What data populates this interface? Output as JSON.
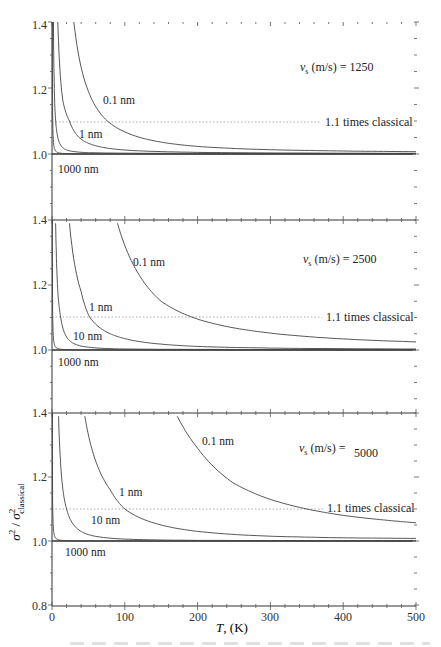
{
  "chart_data": {
    "type": "line",
    "layout": "3 vertically stacked panels sharing x-axis",
    "xlabel": "T, (K)",
    "ylabel": "σ²/σ²classical",
    "xlim": [
      0,
      500
    ],
    "x_ticks": [
      0,
      100,
      200,
      300,
      400,
      500
    ],
    "grid": false,
    "reference_line": {
      "y": 1.1,
      "style": "dotted",
      "label": "1.1 times classical"
    },
    "panels": [
      {
        "annotation": "vs (m/s) = 1250",
        "vs": 1250,
        "ylim": [
          0.8,
          1.4
        ],
        "y_tick_labels": [
          "1.4",
          "1.2",
          "1.0"
        ],
        "series": [
          {
            "name": "0.1 nm",
            "x": [
              30,
              50,
              76,
              100,
              150,
              200,
              300,
              400,
              500
            ],
            "y": [
              1.4,
              1.19,
              1.1,
              1.067,
              1.036,
              1.023,
              1.013,
              1.009,
              1.007
            ]
          },
          {
            "name": "1 nm",
            "x": [
              8,
              15,
              24,
              40,
              60,
              100,
              200,
              500
            ],
            "y": [
              1.4,
              1.16,
              1.1,
              1.045,
              1.025,
              1.012,
              1.005,
              1.002
            ]
          },
          {
            "name": "10 nm",
            "x": [
              2,
              4,
              8,
              20,
              50,
              500
            ],
            "y": [
              1.4,
              1.14,
              1.05,
              1.012,
              1.004,
              1.001
            ]
          },
          {
            "name": "1000 nm",
            "x": [
              0.5,
              1,
              3,
              10,
              500
            ],
            "y": [
              1.4,
              1.1,
              1.02,
              1.003,
              1.0
            ]
          }
        ]
      },
      {
        "annotation": "vs (m/s) = 2500",
        "vs": 2500,
        "ylim": [
          0.8,
          1.4
        ],
        "y_tick_labels": [
          "1.4",
          "1.2",
          "1.0"
        ],
        "series": [
          {
            "name": "0.1 nm",
            "x": [
              90,
              120,
              150,
              200,
              250,
              300,
              400,
              500
            ],
            "y": [
              1.39,
              1.23,
              1.15,
              1.095,
              1.068,
              1.052,
              1.034,
              1.025
            ]
          },
          {
            "name": "1 nm",
            "x": [
              24,
              40,
              52,
              80,
              100,
              150,
              200,
              300,
              500
            ],
            "y": [
              1.39,
              1.18,
              1.1,
              1.05,
              1.035,
              1.018,
              1.011,
              1.006,
              1.003
            ]
          },
          {
            "name": "10 nm",
            "x": [
              5,
              8,
              12,
              20,
              40,
              100,
              500
            ],
            "y": [
              1.39,
              1.18,
              1.1,
              1.04,
              1.012,
              1.003,
              1.001
            ]
          },
          {
            "name": "1000 nm",
            "x": [
              0.5,
              1,
              3,
              10,
              500
            ],
            "y": [
              1.4,
              1.1,
              1.02,
              1.003,
              1.0
            ]
          }
        ]
      },
      {
        "annotation": "vs (m/s) = 5000",
        "vs": 5000,
        "ylim": [
          0.8,
          1.4
        ],
        "y_tick_labels": [
          "1.4",
          "1.2",
          "1.0",
          "0.8"
        ],
        "series": [
          {
            "name": "0.1 nm",
            "x": [
              172,
              200,
              250,
              300,
              350,
              400,
              450,
              500
            ],
            "y": [
              1.39,
              1.29,
              1.18,
              1.13,
              1.1,
              1.08,
              1.067,
              1.057
            ]
          },
          {
            "name": "1 nm",
            "x": [
              45,
              60,
              80,
              100,
              150,
              200,
              300,
              400,
              500
            ],
            "y": [
              1.39,
              1.25,
              1.16,
              1.1,
              1.05,
              1.03,
              1.015,
              1.01,
              1.008
            ]
          },
          {
            "name": "10 nm",
            "x": [
              9,
              15,
              20,
              30,
              50,
              100,
              200,
              500
            ],
            "y": [
              1.39,
              1.16,
              1.1,
              1.05,
              1.02,
              1.006,
              1.002,
              1.001
            ]
          },
          {
            "name": "1000 nm",
            "x": [
              0.5,
              1,
              3,
              10,
              500
            ],
            "y": [
              1.4,
              1.1,
              1.02,
              1.003,
              1.0
            ]
          }
        ]
      }
    ]
  },
  "labels": {
    "p1": {
      "annotation_prefix": "v",
      "annotation_sub": "s",
      "annotation_rest": " (m/s) = 1250",
      "ref": "1.1 times classical",
      "c01": "0.1 nm",
      "c1": "1 nm",
      "c1000": "1000 nm"
    },
    "p2": {
      "annotation_prefix": "v",
      "annotation_sub": "s",
      "annotation_rest": " (m/s) = 2500",
      "ref": "1.1 times classical",
      "c01": "0.1 nm",
      "c1": "1 nm",
      "c10": "10 nm",
      "c1000": "1000 nm"
    },
    "p3": {
      "annotation_prefix": "v",
      "annotation_sub": "s",
      "annotation_rest": " (m/s) =",
      "annotation_value": "5000",
      "ref": "1.1 times classical",
      "c01": "0.1 nm",
      "c1": "1 nm",
      "c10": "10 nm",
      "c1000": "1000 nm"
    },
    "yticks": {
      "a": "1.4",
      "b": "1.2",
      "c": "1.0",
      "d": "0.8"
    },
    "xticks": [
      "0",
      "100",
      "200",
      "300",
      "400",
      "500"
    ],
    "xlabel_T": "T",
    "xlabel_unit": ", (K)",
    "ylabel_sigma": "σ",
    "ylabel_sub": "classical"
  }
}
